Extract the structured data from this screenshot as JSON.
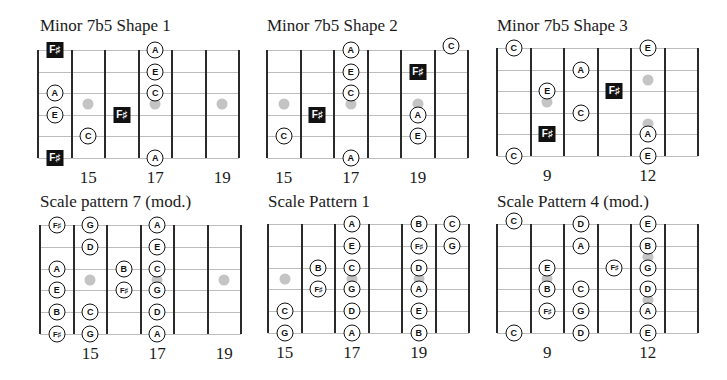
{
  "colors": {
    "line": "#2a2a2a",
    "string": "#bdbdbd",
    "dot": "#c4c4c4",
    "root_bg": "#111111",
    "note_border": "#111111"
  },
  "panels": [
    {
      "id": "p1",
      "title": "Minor 7b5 Shape 1",
      "title_pos": [
        40,
        16
      ],
      "x0": 38,
      "y0": 50,
      "fret_w": 33.5,
      "string_gap": 21.6,
      "frets": 6,
      "dots": [
        [
          1,
          2.5
        ],
        [
          3,
          2.5
        ],
        [
          5,
          2.5
        ]
      ],
      "notes": [
        {
          "label": "F♯",
          "type": "root",
          "col": 0,
          "str": 0
        },
        {
          "label": "A",
          "type": "note",
          "col": 3,
          "str": 0
        },
        {
          "label": "E",
          "type": "note",
          "col": 3,
          "str": 1
        },
        {
          "label": "A",
          "type": "note",
          "col": 0,
          "str": 2
        },
        {
          "label": "C",
          "type": "note",
          "col": 3,
          "str": 2
        },
        {
          "label": "E",
          "type": "note",
          "col": 0,
          "str": 3
        },
        {
          "label": "F♯",
          "type": "root",
          "col": 2,
          "str": 3
        },
        {
          "label": "C",
          "type": "note",
          "col": 1,
          "str": 4
        },
        {
          "label": "F♯",
          "type": "root",
          "col": 0,
          "str": 5
        },
        {
          "label": "A",
          "type": "note",
          "col": 3,
          "str": 5
        }
      ],
      "fret_labels": [
        {
          "text": "15",
          "col": 1
        },
        {
          "text": "17",
          "col": 3
        },
        {
          "text": "19",
          "col": 5
        }
      ]
    },
    {
      "id": "p2",
      "title": "Minor 7b5 Shape 2",
      "title_pos": [
        267,
        16
      ],
      "x0": 267,
      "y0": 50,
      "fret_w": 33.5,
      "string_gap": 21.6,
      "frets": 6,
      "dots": [
        [
          0,
          2.5
        ],
        [
          2,
          2.5
        ],
        [
          4,
          2.5
        ]
      ],
      "notes": [
        {
          "label": "A",
          "type": "note",
          "col": 2,
          "str": 0
        },
        {
          "label": "C",
          "type": "note",
          "col": 5,
          "str": -0.2
        },
        {
          "label": "E",
          "type": "note",
          "col": 2,
          "str": 1
        },
        {
          "label": "F♯",
          "type": "root",
          "col": 4,
          "str": 1
        },
        {
          "label": "C",
          "type": "note",
          "col": 2,
          "str": 2
        },
        {
          "label": "F♯",
          "type": "root",
          "col": 1,
          "str": 3
        },
        {
          "label": "A",
          "type": "note",
          "col": 4,
          "str": 3
        },
        {
          "label": "C",
          "type": "note",
          "col": 0,
          "str": 4
        },
        {
          "label": "E",
          "type": "note",
          "col": 4,
          "str": 4
        },
        {
          "label": "A",
          "type": "note",
          "col": 2,
          "str": 5
        }
      ],
      "fret_labels": [
        {
          "text": "15",
          "col": 0
        },
        {
          "text": "17",
          "col": 2
        },
        {
          "text": "19",
          "col": 4
        }
      ]
    },
    {
      "id": "p3",
      "title": "Minor 7b5 Shape 3",
      "title_pos": [
        497,
        16
      ],
      "x0": 497,
      "y0": 48,
      "fret_w": 33.5,
      "string_gap": 21.6,
      "frets": 6,
      "dots": [
        [
          4,
          1.5
        ],
        [
          1,
          2.5
        ],
        [
          4,
          3.5
        ]
      ],
      "notes": [
        {
          "label": "C",
          "type": "note",
          "col": 0,
          "str": 0
        },
        {
          "label": "E",
          "type": "note",
          "col": 4,
          "str": 0
        },
        {
          "label": "A",
          "type": "note",
          "col": 2,
          "str": 1
        },
        {
          "label": "E",
          "type": "note",
          "col": 1,
          "str": 2
        },
        {
          "label": "F♯",
          "type": "root",
          "col": 3,
          "str": 2
        },
        {
          "label": "C",
          "type": "note",
          "col": 2,
          "str": 3
        },
        {
          "label": "F♯",
          "type": "root",
          "col": 1,
          "str": 4
        },
        {
          "label": "A",
          "type": "note",
          "col": 4,
          "str": 4
        },
        {
          "label": "C",
          "type": "note",
          "col": 0,
          "str": 5
        },
        {
          "label": "E",
          "type": "note",
          "col": 4,
          "str": 5
        }
      ],
      "fret_labels": [
        {
          "text": "9",
          "col": 1
        },
        {
          "text": "12",
          "col": 4
        }
      ]
    },
    {
      "id": "p4",
      "title": "Scale pattern 7 (mod.)",
      "title_pos": [
        40,
        192
      ],
      "x0": 40,
      "y0": 225,
      "fret_w": 33.5,
      "string_gap": 21.8,
      "frets": 6,
      "dots": [
        [
          1,
          2.5
        ],
        [
          3,
          2.5
        ],
        [
          5,
          2.5
        ]
      ],
      "notes": [
        {
          "label": "F♯",
          "type": "note",
          "col": 0,
          "str": 0
        },
        {
          "label": "G",
          "type": "note",
          "col": 1,
          "str": 0
        },
        {
          "label": "A",
          "type": "note",
          "col": 3,
          "str": 0
        },
        {
          "label": "D",
          "type": "note",
          "col": 1,
          "str": 1
        },
        {
          "label": "E",
          "type": "note",
          "col": 3,
          "str": 1
        },
        {
          "label": "A",
          "type": "note",
          "col": 0,
          "str": 2
        },
        {
          "label": "B",
          "type": "note",
          "col": 2,
          "str": 2
        },
        {
          "label": "C",
          "type": "note",
          "col": 3,
          "str": 2
        },
        {
          "label": "E",
          "type": "note",
          "col": 0,
          "str": 3
        },
        {
          "label": "F♯",
          "type": "note",
          "col": 2,
          "str": 3
        },
        {
          "label": "G",
          "type": "note",
          "col": 3,
          "str": 3
        },
        {
          "label": "B",
          "type": "note",
          "col": 0,
          "str": 4
        },
        {
          "label": "C",
          "type": "note",
          "col": 1,
          "str": 4
        },
        {
          "label": "D",
          "type": "note",
          "col": 3,
          "str": 4
        },
        {
          "label": "F♯",
          "type": "note",
          "col": 0,
          "str": 5
        },
        {
          "label": "G",
          "type": "note",
          "col": 1,
          "str": 5
        },
        {
          "label": "A",
          "type": "note",
          "col": 3,
          "str": 5
        }
      ],
      "fret_labels": [
        {
          "text": "15",
          "col": 1
        },
        {
          "text": "17",
          "col": 3
        },
        {
          "text": "19",
          "col": 5
        }
      ]
    },
    {
      "id": "p5",
      "title": "Scale Pattern 1",
      "title_pos": [
        268,
        192
      ],
      "x0": 268,
      "y0": 224,
      "fret_w": 33.5,
      "string_gap": 21.8,
      "frets": 6,
      "dots": [
        [
          0,
          2.5
        ],
        [
          2,
          2.5
        ],
        [
          4,
          2.5
        ]
      ],
      "notes": [
        {
          "label": "A",
          "type": "note",
          "col": 2,
          "str": 0
        },
        {
          "label": "B",
          "type": "note",
          "col": 4,
          "str": 0
        },
        {
          "label": "C",
          "type": "note",
          "col": 5,
          "str": 0
        },
        {
          "label": "E",
          "type": "note",
          "col": 2,
          "str": 1
        },
        {
          "label": "F♯",
          "type": "note",
          "col": 4,
          "str": 1
        },
        {
          "label": "G",
          "type": "note",
          "col": 5,
          "str": 1
        },
        {
          "label": "B",
          "type": "note",
          "col": 1,
          "str": 2
        },
        {
          "label": "C",
          "type": "note",
          "col": 2,
          "str": 2
        },
        {
          "label": "D",
          "type": "note",
          "col": 4,
          "str": 2
        },
        {
          "label": "F♯",
          "type": "note",
          "col": 1,
          "str": 3
        },
        {
          "label": "G",
          "type": "note",
          "col": 2,
          "str": 3
        },
        {
          "label": "A",
          "type": "note",
          "col": 4,
          "str": 3
        },
        {
          "label": "C",
          "type": "note",
          "col": 0,
          "str": 4
        },
        {
          "label": "D",
          "type": "note",
          "col": 2,
          "str": 4
        },
        {
          "label": "E",
          "type": "note",
          "col": 4,
          "str": 4
        },
        {
          "label": "G",
          "type": "note",
          "col": 0,
          "str": 5
        },
        {
          "label": "A",
          "type": "note",
          "col": 2,
          "str": 5
        },
        {
          "label": "B",
          "type": "note",
          "col": 4,
          "str": 5
        }
      ],
      "fret_labels": [
        {
          "text": "15",
          "col": 0
        },
        {
          "text": "17",
          "col": 2
        },
        {
          "text": "19",
          "col": 4
        }
      ]
    },
    {
      "id": "p6",
      "title": "Scale Pattern 4 (mod.)",
      "title_pos": [
        497,
        192
      ],
      "x0": 497,
      "y0": 224,
      "fret_w": 33.5,
      "string_gap": 21.8,
      "frets": 6,
      "dots": [
        [
          1,
          2.5
        ],
        [
          4,
          1.5
        ],
        [
          4,
          3.5
        ]
      ],
      "notes": [
        {
          "label": "C",
          "type": "note",
          "col": 0,
          "str": -0.15
        },
        {
          "label": "D",
          "type": "note",
          "col": 2,
          "str": 0
        },
        {
          "label": "E",
          "type": "note",
          "col": 4,
          "str": 0
        },
        {
          "label": "A",
          "type": "note",
          "col": 2,
          "str": 1
        },
        {
          "label": "B",
          "type": "note",
          "col": 4,
          "str": 1
        },
        {
          "label": "E",
          "type": "note",
          "col": 1,
          "str": 2
        },
        {
          "label": "F♯",
          "type": "note",
          "col": 3,
          "str": 2
        },
        {
          "label": "G",
          "type": "note",
          "col": 4,
          "str": 2
        },
        {
          "label": "B",
          "type": "note",
          "col": 1,
          "str": 3
        },
        {
          "label": "C",
          "type": "note",
          "col": 2,
          "str": 3
        },
        {
          "label": "D",
          "type": "note",
          "col": 4,
          "str": 3
        },
        {
          "label": "F♯",
          "type": "note",
          "col": 1,
          "str": 4
        },
        {
          "label": "G",
          "type": "note",
          "col": 2,
          "str": 4
        },
        {
          "label": "A",
          "type": "note",
          "col": 4,
          "str": 4
        },
        {
          "label": "C",
          "type": "note",
          "col": 0,
          "str": 5
        },
        {
          "label": "D",
          "type": "note",
          "col": 2,
          "str": 5
        },
        {
          "label": "E",
          "type": "note",
          "col": 4,
          "str": 5
        }
      ],
      "fret_labels": [
        {
          "text": "9",
          "col": 1
        },
        {
          "text": "12",
          "col": 4
        }
      ]
    }
  ]
}
